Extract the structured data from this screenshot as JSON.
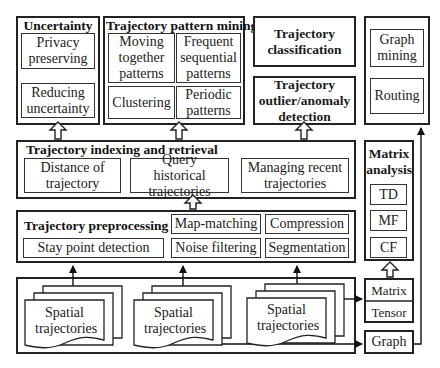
{
  "uncertainty": {
    "title": "Uncertainty",
    "items": [
      "Privacy preserving",
      "Reducing uncertainty"
    ]
  },
  "pattern_mining": {
    "title": "Trajectory pattern mining",
    "items": [
      "Moving together patterns",
      "Frequent sequential patterns",
      "Clustering",
      "Periodic patterns"
    ]
  },
  "classification": {
    "title": "Trajectory classification"
  },
  "outlier": {
    "title": "Trajectory outlier/anomaly detection"
  },
  "graph_app": {
    "items": [
      "Graph mining",
      "Routing"
    ]
  },
  "indexing": {
    "title": "Trajectory indexing and retrieval",
    "items": [
      "Distance of trajectory",
      "Query historical trajectories",
      "Managing recent trajectories"
    ]
  },
  "matrix_analysis": {
    "title": "Matrix analysis",
    "items": [
      "TD",
      "MF",
      "CF"
    ]
  },
  "preprocessing": {
    "title": "Trajectory preprocessing",
    "items": [
      "Map-matching",
      "Compression",
      "Stay point detection",
      "Noise filtering",
      "Segmentation"
    ]
  },
  "sources": {
    "items": [
      "Spatial trajectories",
      "Spatial trajectories",
      "Spatial trajectories"
    ]
  },
  "representations": {
    "matrix": "Matrix",
    "tensor": "Tensor",
    "graph": "Graph"
  }
}
